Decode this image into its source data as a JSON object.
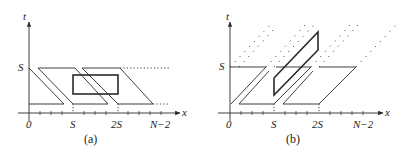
{
  "panels": [
    {
      "id": "a",
      "caption": "(a)",
      "axis_x_label": "x",
      "axis_y_label": "t",
      "y_tick_label": "S",
      "x_tick_labels": [
        "0",
        "S",
        "2S",
        "N−2"
      ]
    },
    {
      "id": "b",
      "caption": "(b)",
      "axis_x_label": "x",
      "axis_y_label": "t",
      "y_tick_label": "S",
      "x_tick_labels": [
        "0",
        "S",
        "2S",
        "N−2"
      ]
    }
  ],
  "colors": {
    "stroke": "#2a2a2a",
    "background": "#ffffff"
  }
}
